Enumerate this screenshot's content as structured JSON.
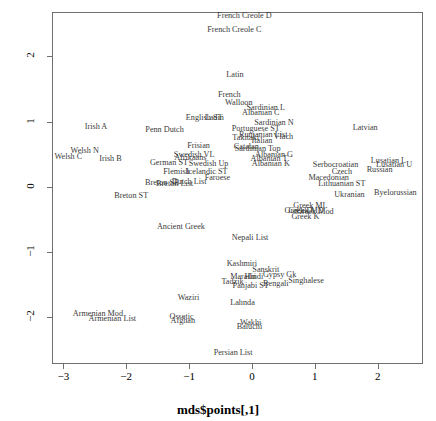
{
  "chart_data": {
    "type": "scatter",
    "title": "",
    "xlabel": "mds$points[,1]",
    "ylabel": "mds$points[,3]",
    "xlim": [
      -3.18,
      2.72
    ],
    "ylim": [
      -2.72,
      2.68
    ],
    "xticks": [
      "-3",
      "-2",
      "-1",
      "0",
      "1",
      "2"
    ],
    "xtickvals": [
      -3,
      -2,
      -1,
      0,
      1,
      2
    ],
    "yticks": [
      "-2",
      "-1",
      "0",
      "1",
      "2"
    ],
    "ytickvals": [
      -2,
      -1,
      0,
      1,
      2
    ],
    "grid": false,
    "legend": "none",
    "marker": "text-label",
    "points": [
      {
        "label": "French Creole D",
        "x": -0.12,
        "y": 2.62
      },
      {
        "label": "French Creole C",
        "x": -0.28,
        "y": 2.4
      },
      {
        "label": "Latin",
        "x": -0.27,
        "y": 1.72
      },
      {
        "label": "French",
        "x": -0.36,
        "y": 1.41
      },
      {
        "label": "Walloon",
        "x": -0.21,
        "y": 1.28
      },
      {
        "label": "Sardinian L",
        "x": 0.22,
        "y": 1.2
      },
      {
        "label": "Albanian C",
        "x": 0.14,
        "y": 1.13
      },
      {
        "label": "English ST",
        "x": -0.76,
        "y": 1.06
      },
      {
        "label": "Ladin",
        "x": -0.6,
        "y": 1.05
      },
      {
        "label": "Sardinian N",
        "x": 0.35,
        "y": 0.97
      },
      {
        "label": "Irish A",
        "x": -2.48,
        "y": 0.92
      },
      {
        "label": "Penn Dutch",
        "x": -1.39,
        "y": 0.87
      },
      {
        "label": "Portuguese ST",
        "x": 0.06,
        "y": 0.88
      },
      {
        "label": "Latvian",
        "x": 1.8,
        "y": 0.9
      },
      {
        "label": "Rumanian List",
        "x": 0.18,
        "y": 0.8
      },
      {
        "label": "Takitaki",
        "x": -0.1,
        "y": 0.74
      },
      {
        "label": "Vlach",
        "x": 0.5,
        "y": 0.76
      },
      {
        "label": "Italian",
        "x": 0.16,
        "y": 0.7
      },
      {
        "label": "Frisian",
        "x": -0.85,
        "y": 0.63
      },
      {
        "label": "Catalan",
        "x": -0.09,
        "y": 0.61
      },
      {
        "label": "Sardinian Top",
        "x": 0.09,
        "y": 0.58
      },
      {
        "label": "Welsh N",
        "x": -2.66,
        "y": 0.55
      },
      {
        "label": "Swedish VL",
        "x": -0.92,
        "y": 0.49
      },
      {
        "label": "Albanian G",
        "x": 0.35,
        "y": 0.49
      },
      {
        "label": "Welsh C",
        "x": -2.92,
        "y": 0.46
      },
      {
        "label": "Afrikaans",
        "x": -0.98,
        "y": 0.44
      },
      {
        "label": "Albanian T",
        "x": 0.27,
        "y": 0.43
      },
      {
        "label": "Irish B",
        "x": -2.25,
        "y": 0.42
      },
      {
        "label": "German ST",
        "x": -1.32,
        "y": 0.36
      },
      {
        "label": "Swedish Up",
        "x": -0.69,
        "y": 0.35
      },
      {
        "label": "Albanian K",
        "x": 0.3,
        "y": 0.35
      },
      {
        "label": "Serbocroatian",
        "x": 1.33,
        "y": 0.33
      },
      {
        "label": "Lusatian L",
        "x": 2.17,
        "y": 0.4
      },
      {
        "label": "Lusatian U",
        "x": 2.26,
        "y": 0.33
      },
      {
        "label": "Russian",
        "x": 2.03,
        "y": 0.26
      },
      {
        "label": "Flemish",
        "x": -1.2,
        "y": 0.23
      },
      {
        "label": "Icelandic ST",
        "x": -0.72,
        "y": 0.23
      },
      {
        "label": "Czech",
        "x": 1.43,
        "y": 0.22
      },
      {
        "label": "Faroese",
        "x": -0.55,
        "y": 0.14
      },
      {
        "label": "Macedonian",
        "x": 1.22,
        "y": 0.14
      },
      {
        "label": "Dutch List",
        "x": -1.0,
        "y": 0.07
      },
      {
        "label": "Breton SE",
        "x": -1.43,
        "y": 0.05
      },
      {
        "label": "Breton List",
        "x": -1.23,
        "y": 0.04
      },
      {
        "label": "Lithuanian ST",
        "x": 1.43,
        "y": 0.04
      },
      {
        "label": "Ukranian",
        "x": 1.55,
        "y": -0.12
      },
      {
        "label": "Byelorussian",
        "x": 2.28,
        "y": -0.1
      },
      {
        "label": "Breton ST",
        "x": -1.92,
        "y": -0.14
      },
      {
        "label": "Greek ML",
        "x": 0.93,
        "y": -0.3
      },
      {
        "label": "Greek MD",
        "x": 0.86,
        "y": -0.38
      },
      {
        "label": "Greek Mod",
        "x": 1.0,
        "y": -0.39
      },
      {
        "label": "Greek D",
        "x": 0.74,
        "y": -0.38
      },
      {
        "label": "Greek K",
        "x": 0.85,
        "y": -0.47
      },
      {
        "label": "Ancient Greek",
        "x": -1.13,
        "y": -0.62
      },
      {
        "label": "Nepali List",
        "x": -0.03,
        "y": -0.78
      },
      {
        "label": "Kashmiri",
        "x": -0.16,
        "y": -1.18
      },
      {
        "label": "Sanskrit",
        "x": 0.22,
        "y": -1.28
      },
      {
        "label": "Marathi",
        "x": -0.14,
        "y": -1.39
      },
      {
        "label": "Hindi",
        "x": 0.03,
        "y": -1.39
      },
      {
        "label": "Gypsy Gk",
        "x": 0.44,
        "y": -1.36
      },
      {
        "label": "Singhalese",
        "x": 0.86,
        "y": -1.45
      },
      {
        "label": "Tadzik",
        "x": -0.31,
        "y": -1.46
      },
      {
        "label": "Panjabi ST",
        "x": -0.02,
        "y": -1.52
      },
      {
        "label": "Bengali",
        "x": 0.38,
        "y": -1.5
      },
      {
        "label": "Waziri",
        "x": -1.01,
        "y": -1.7
      },
      {
        "label": "Lahnda",
        "x": -0.15,
        "y": -1.78
      },
      {
        "label": "Armenian Mod",
        "x": -2.45,
        "y": -1.95
      },
      {
        "label": "Armenian List",
        "x": -2.22,
        "y": -2.03
      },
      {
        "label": "Ossetic",
        "x": -1.12,
        "y": -2.0
      },
      {
        "label": "Afghan",
        "x": -1.1,
        "y": -2.06
      },
      {
        "label": "Wakhi",
        "x": -0.02,
        "y": -2.09
      },
      {
        "label": "Baluchi",
        "x": -0.04,
        "y": -2.16
      },
      {
        "label": "Persian List",
        "x": -0.3,
        "y": -2.55
      }
    ]
  }
}
